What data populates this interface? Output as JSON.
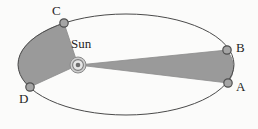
{
  "figure": {
    "background_color": "#fbfbfa"
  },
  "colors": {
    "sector_fill": "#9a9a9a",
    "sector_stroke": "#8c8c8c",
    "orbit_stroke": "#4a4a4a",
    "marker_fill": "#a5a5a5",
    "marker_stroke": "#4f4f4f",
    "sun_outer": "#b9b9b9",
    "sun_ring": "#7d7d7d",
    "sun_core": "#6e6e6e",
    "label_color": "#252525"
  },
  "orbit": {
    "name": "elliptical-orbit",
    "center_x": 126,
    "center_y": 64.5,
    "radius_x": 108,
    "radius_y": 50.5,
    "stroke_width": 1
  },
  "sun": {
    "label": "Sun",
    "x": 78,
    "y": 65,
    "label_x": 71,
    "label_y": 37,
    "outer_radius": 8,
    "mid_radius": 5.4,
    "inner_radius": 2.6
  },
  "points": [
    {
      "id": "A",
      "label": "A",
      "x": 228,
      "y": 83,
      "label_x": 236,
      "label_y": 80,
      "marker_radius": 4.2
    },
    {
      "id": "B",
      "label": "B",
      "x": 227,
      "y": 50,
      "label_x": 236,
      "label_y": 41,
      "marker_radius": 4.2
    },
    {
      "id": "C",
      "label": "C",
      "x": 64,
      "y": 23,
      "label_x": 52,
      "label_y": 4,
      "marker_radius": 4.2
    },
    {
      "id": "D",
      "label": "D",
      "x": 30,
      "y": 87,
      "label_x": 19,
      "label_y": 92,
      "marker_radius": 4.2
    }
  ],
  "sectors": [
    {
      "name": "swept-area-ab",
      "description": "Thin wedge swept from Sun to arc between A and B (near perihelion side shown far)",
      "path": "M 78 65 L 227 50 A 108 50.5 0 0 1 228 83 Z"
    },
    {
      "name": "swept-area-cd",
      "description": "Broad wedge swept from Sun to arc between C and D",
      "path": "M 78 65 L 64 23 A 108 50.5 0 0 0 30 87 Z"
    }
  ]
}
